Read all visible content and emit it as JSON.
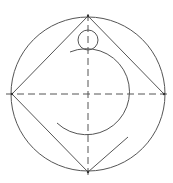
{
  "diagram": {
    "title": "Geometric construction: circle with inscribed square, centerlines, small circle and open arc",
    "stroke_color": "#555555",
    "background": "#ffffff",
    "outer_circle": {
      "cx": 88,
      "cy": 94,
      "r": 77
    },
    "square_vertices": {
      "top": [
        88,
        16
      ],
      "right": [
        164,
        94
      ],
      "bottom": [
        88,
        172
      ],
      "left": [
        12,
        94
      ]
    },
    "partial_edge": {
      "from": [
        88,
        172
      ],
      "to": [
        128,
        137
      ]
    },
    "horizontal_centerline": {
      "from": [
        6,
        94
      ],
      "to": [
        168,
        94
      ]
    },
    "vertical_centerline": {
      "from": [
        88,
        14
      ],
      "to": [
        88,
        176
      ]
    },
    "small_circle": {
      "cx": 88,
      "cy": 40,
      "r": 10
    },
    "arc": {
      "cx": 88,
      "cy": 93,
      "r": 43,
      "start": [
        70,
        52
      ],
      "end": [
        57,
        123
      ]
    }
  }
}
